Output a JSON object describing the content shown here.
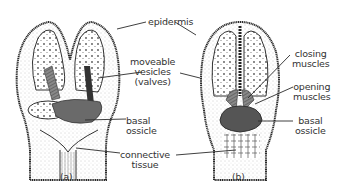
{
  "figure": {
    "panels": [
      {
        "id": "a",
        "caption": "(a)"
      },
      {
        "id": "b",
        "caption": "(b)"
      }
    ],
    "labels": {
      "epidermis": "epidermis",
      "moveable_vesicles_line1": "moveable",
      "moveable_vesicles_line2": "vesicles",
      "moveable_vesicles_line3": "(valves)",
      "basal_ossicle_a_line1": "basal",
      "basal_ossicle_a_line2": "ossicle",
      "connective_tissue_line1": "connective",
      "connective_tissue_line2": "tissue",
      "closing_muscles_line1": "closing",
      "closing_muscles_line2": "muscles",
      "opening_muscles_line1": "opening",
      "opening_muscles_line2": "muscles",
      "basal_ossicle_b_line1": "basal",
      "basal_ossicle_b_line2": "ossicle"
    },
    "colors": {
      "ink": "#2a2a2a",
      "muscle": "#6a6a6a",
      "ossicle": "#555555",
      "stipple": "#bdbdbd"
    }
  }
}
